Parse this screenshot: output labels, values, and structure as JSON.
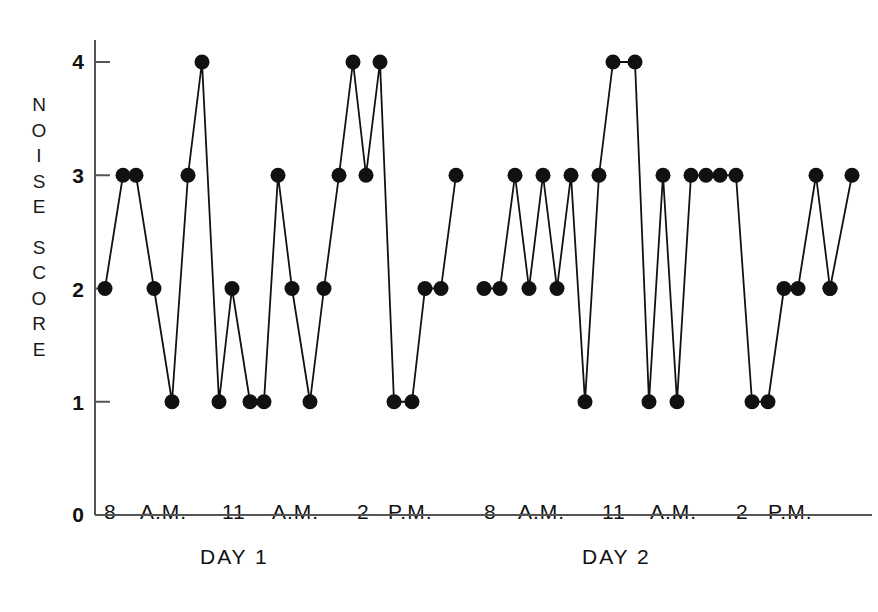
{
  "chart_data": {
    "type": "line",
    "title": "",
    "subtitle": "",
    "xlabel": "",
    "ylabel": "NOISE SCORE",
    "ylim": [
      0,
      4.35
    ],
    "yticks": [
      0,
      1,
      2,
      3,
      4
    ],
    "ytick_labels": [
      "0",
      "1",
      "2",
      "3",
      "4"
    ],
    "grid": false,
    "legend": "none",
    "marker": "filled-circle",
    "marker_color": "#111111",
    "line_color": "#111111",
    "x_axis_groups": [
      {
        "group_label": "DAY 1",
        "tick_labels": [
          "8",
          "A.M.",
          "11",
          "A.M.",
          "2",
          "P.M."
        ]
      },
      {
        "group_label": "DAY 2",
        "tick_labels": [
          "8",
          "A.M.",
          "11",
          "A.M.",
          "2",
          "P.M."
        ]
      }
    ],
    "series": [
      {
        "name": "DAY 1",
        "x": [
          105,
          123,
          136,
          154,
          172,
          188,
          202,
          219,
          232,
          250,
          264,
          278,
          292,
          310,
          324,
          339,
          353,
          366,
          380,
          394,
          412,
          425,
          441,
          456
        ],
        "values": [
          2,
          3,
          3,
          2,
          1,
          3,
          4,
          1,
          2,
          1,
          1,
          3,
          2,
          1,
          2,
          3,
          4,
          3,
          4,
          1,
          1,
          2,
          2,
          3
        ]
      },
      {
        "name": "DAY 2",
        "x": [
          484,
          500,
          515,
          529,
          543,
          557,
          571,
          585,
          599,
          613,
          635,
          649,
          663,
          677,
          691,
          706,
          720,
          736,
          752,
          768,
          784,
          798,
          816,
          830
        ],
        "values": [
          2,
          2,
          3,
          2,
          3,
          2,
          3,
          1,
          3,
          4,
          4,
          1,
          3,
          1,
          3,
          3,
          3,
          3,
          1,
          1,
          2,
          2,
          3,
          2
        ]
      },
      {
        "name": "DAY 2 tail",
        "x": [
          830,
          852
        ],
        "values": [
          2,
          3
        ]
      }
    ]
  },
  "axis": {
    "ytick_labels": [
      {
        "text": "4",
        "value": 4
      },
      {
        "text": "3",
        "value": 3
      },
      {
        "text": "2",
        "value": 2
      },
      {
        "text": "1",
        "value": 1
      },
      {
        "text": "0",
        "value": 0
      }
    ],
    "ylabel_letters": [
      "N",
      "O",
      "I",
      "S",
      "E",
      "S",
      "C",
      "O",
      "R",
      "E"
    ],
    "xtick_labels": [
      {
        "text": "8",
        "x": 110
      },
      {
        "text": "A.M.",
        "x": 152
      },
      {
        "text": "11",
        "x": 232
      },
      {
        "text": "A.M.",
        "x": 285
      },
      {
        "text": "2",
        "x": 363
      },
      {
        "text": "P.M.",
        "x": 400
      },
      {
        "text": "8",
        "x": 490
      },
      {
        "text": "A.M.",
        "x": 530
      },
      {
        "text": "11",
        "x": 612
      },
      {
        "text": "A.M.",
        "x": 663
      },
      {
        "text": "2",
        "x": 742
      },
      {
        "text": "P.M.",
        "x": 780
      }
    ],
    "group_labels": [
      {
        "text": "DAY 1",
        "x": 232
      },
      {
        "text": "DAY 2",
        "x": 612
      }
    ]
  }
}
